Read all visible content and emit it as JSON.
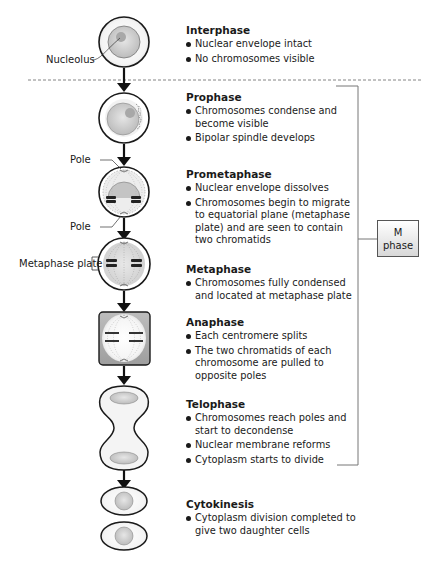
{
  "labels": {
    "nucleolus": "Nucleolus",
    "pole_top": "Pole",
    "pole_bottom": "Pole",
    "metaphase_plate": "Metaphase plate"
  },
  "m_phase": {
    "line1": "M",
    "line2": "phase"
  },
  "stages": [
    {
      "title": "Interphase",
      "bullets": [
        "Nuclear envelope intact",
        "No chromosomes visible"
      ]
    },
    {
      "title": "Prophase",
      "bullets": [
        "Chromosomes condense and become visible",
        "Bipolar spindle develops"
      ]
    },
    {
      "title": "Prometaphase",
      "bullets": [
        "Nuclear envelope dissolves",
        "Chromosomes begin to migrate to equatorial plane (metaphase plate) and are seen to contain two chromatids"
      ]
    },
    {
      "title": "Metaphase",
      "bullets": [
        "Chromosomes fully condensed and located at metaphase plate"
      ]
    },
    {
      "title": "Anaphase",
      "bullets": [
        "Each centromere splits",
        "The two chromatids of each chromosome are pulled to opposite poles"
      ]
    },
    {
      "title": "Telophase",
      "bullets": [
        "Chromosomes reach poles and start to decondense",
        "Nuclear membrane reforms",
        "Cytoplasm starts to divide"
      ]
    },
    {
      "title": "Cytokinesis",
      "bullets": [
        "Cytoplasm division completed to give two daughter cells"
      ]
    }
  ],
  "colors": {
    "outline": "#1a1a1a",
    "cell_fill": "#ffffff",
    "nucleus": "#c8c8c8",
    "bracket": "#777777",
    "dash": "#666666"
  }
}
